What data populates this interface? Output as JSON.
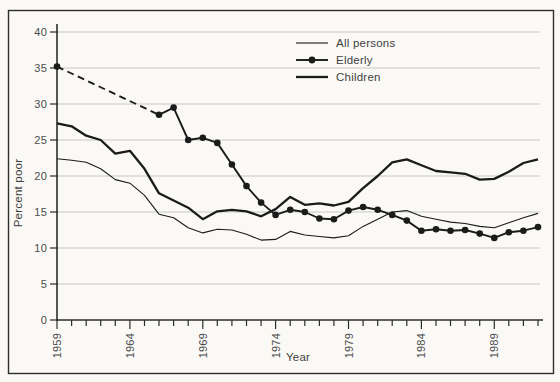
{
  "chart_data": {
    "type": "line",
    "title": "",
    "xlabel": "Year",
    "ylabel": "Percent poor",
    "xlim": [
      1959,
      1992
    ],
    "ylim": [
      0,
      40
    ],
    "y_ticks": [
      0,
      5,
      10,
      15,
      20,
      25,
      30,
      35,
      40
    ],
    "x_labeled_ticks": [
      1959,
      1964,
      1969,
      1974,
      1979,
      1984,
      1989
    ],
    "x_minor_ticks": "every year 1959-1992",
    "grid": "horizontal light gridlines at every 5 units",
    "legend_position": "inside top, center-right",
    "note": "Elderly series has no annual data 1960-1965; 1959 point is joined to 1966 by a dashed line. Black-and-white scanned textbook figure.",
    "years": [
      1959,
      1960,
      1961,
      1962,
      1963,
      1964,
      1965,
      1966,
      1967,
      1968,
      1969,
      1970,
      1971,
      1972,
      1973,
      1974,
      1975,
      1976,
      1977,
      1978,
      1979,
      1980,
      1981,
      1982,
      1983,
      1984,
      1985,
      1986,
      1987,
      1988,
      1989,
      1990,
      1991,
      1992
    ],
    "series": [
      {
        "id": "all-persons",
        "name": "All persons",
        "line_style": "thin",
        "marker": "none",
        "values": [
          22.4,
          22.2,
          21.9,
          21.0,
          19.5,
          19.0,
          17.3,
          14.7,
          14.2,
          12.8,
          12.1,
          12.6,
          12.5,
          11.9,
          11.1,
          11.2,
          12.3,
          11.8,
          11.6,
          11.4,
          11.7,
          13.0,
          14.0,
          15.0,
          15.2,
          14.4,
          14.0,
          13.6,
          13.4,
          13.0,
          12.8,
          13.5,
          14.2,
          14.8
        ]
      },
      {
        "id": "elderly",
        "name": "Elderly",
        "line_style": "medium",
        "marker": "circle",
        "dashed_lead_segment": true,
        "values": [
          35.2,
          null,
          null,
          null,
          null,
          null,
          null,
          28.5,
          29.5,
          25.0,
          25.3,
          24.6,
          21.6,
          18.6,
          16.3,
          14.6,
          15.3,
          15.0,
          14.1,
          14.0,
          15.2,
          15.7,
          15.3,
          14.6,
          13.8,
          12.4,
          12.6,
          12.4,
          12.5,
          12.0,
          11.4,
          12.2,
          12.4,
          12.9
        ]
      },
      {
        "id": "children",
        "name": "Children",
        "line_style": "thick",
        "marker": "none",
        "values": [
          27.3,
          26.9,
          25.6,
          25.0,
          23.1,
          23.5,
          21.0,
          17.6,
          16.6,
          15.6,
          14.0,
          15.1,
          15.3,
          15.1,
          14.4,
          15.4,
          17.1,
          16.0,
          16.2,
          15.9,
          16.4,
          18.3,
          20.0,
          21.9,
          22.3,
          21.5,
          20.7,
          20.5,
          20.3,
          19.5,
          19.6,
          20.6,
          21.8,
          22.3
        ]
      }
    ],
    "colors": {
      "series": "#1b1b1b",
      "grid": "#c9c8c4",
      "axis": "#2d2d2d",
      "text": "#4c4c4c",
      "background": "#faf9f6",
      "border": "#2e2e2e"
    }
  }
}
